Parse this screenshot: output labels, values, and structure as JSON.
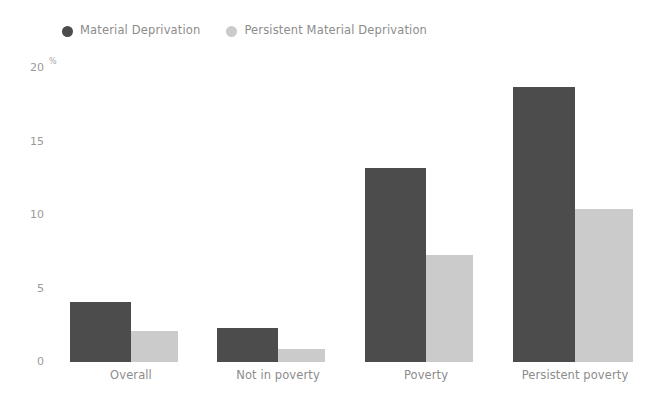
{
  "chart_data": {
    "type": "bar",
    "title": "",
    "subtitle": "",
    "xlabel": "",
    "ylabel": "",
    "unit_label": "%",
    "ylim": [
      0,
      20
    ],
    "yticks": [
      0,
      5,
      10,
      15,
      20
    ],
    "ytick_labels": [
      "0",
      "5",
      "10",
      "15",
      "20"
    ],
    "grid": false,
    "legend_position": "top-left",
    "categories": [
      "Overall",
      "Not in poverty",
      "Poverty",
      "Persistent poverty"
    ],
    "series": [
      {
        "name": "Material Deprivation",
        "color": "#4c4c4c",
        "values": [
          4.1,
          2.3,
          13.2,
          18.7
        ]
      },
      {
        "name": "Persistent Material Deprivation",
        "color": "#cbcbcb",
        "values": [
          2.1,
          0.9,
          7.3,
          10.4
        ]
      }
    ]
  },
  "legend": {
    "items": [
      {
        "label": "Material Deprivation",
        "color": "#4c4c4c"
      },
      {
        "label": "Persistent Material Deprivation",
        "color": "#cbcbcb"
      }
    ]
  },
  "axis": {
    "unit": "%",
    "y_labels": [
      "20",
      "15",
      "10",
      "5",
      "0"
    ],
    "x_labels": [
      "Overall",
      "Not in poverty",
      "Poverty",
      "Persistent poverty"
    ]
  },
  "colors": {
    "background": "#ffffff",
    "series_dark": "#4c4c4c",
    "series_light": "#cbcbcb",
    "text": "#8c8c8c"
  }
}
